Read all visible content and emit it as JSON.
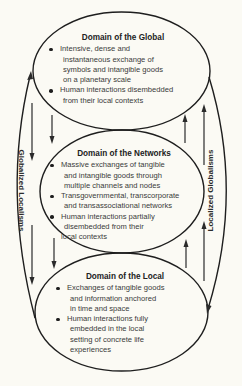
{
  "diagram": {
    "domains": [
      {
        "title": "Domain of the Global",
        "bullets": [
          {
            "lines": [
              "Intensive, dense and",
              "instantaneous exchange of",
              "symbols and intangible goods",
              "on a planetary scale"
            ]
          },
          {
            "lines": [
              "Human interactions disembedded",
              "from their local contexts"
            ]
          }
        ]
      },
      {
        "title": "Domain of the Networks",
        "bullets": [
          {
            "lines": [
              "Massive exchanges of tangible",
              "and intangible goods through",
              "multiple channels and nodes"
            ]
          },
          {
            "lines": [
              "Transgovernmental, transcorporate",
              "and transassociational networks"
            ]
          },
          {
            "lines": [
              "Human interactions partially",
              "disembedded from their",
              "local contexts"
            ]
          }
        ]
      },
      {
        "title": "Domain of the Local",
        "bullets": [
          {
            "lines": [
              "Exchanges of tangible goods",
              "and information anchored",
              "in time and space"
            ]
          },
          {
            "lines": [
              "Human interactions fully",
              "embedded in the local",
              "setting of concrete life",
              "experiences"
            ]
          }
        ]
      }
    ],
    "side_labels": {
      "left": "Globalized Localisms",
      "right": "Localized Globalisms"
    },
    "flows": {
      "left": "downward (Global → Networks → Local), returning upward via outer arc",
      "right": "upward (Local → Networks → Global), returning downward via outer arc"
    }
  }
}
